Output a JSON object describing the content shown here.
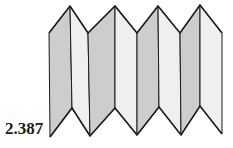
{
  "figure": {
    "label": "2.387",
    "colors": {
      "dark_panel": "#cdcdcd",
      "light_panel": "#efefef",
      "stroke": "#1a1a1a",
      "background": "#ffffff"
    },
    "top_vertices": [
      [
        49,
        33
      ],
      [
        70,
        6
      ],
      [
        88,
        33
      ],
      [
        115,
        6
      ],
      [
        137,
        33
      ],
      [
        158,
        6
      ],
      [
        180,
        33
      ],
      [
        200,
        5
      ],
      [
        222,
        33
      ]
    ],
    "bottom_vertices": [
      [
        50,
        137
      ],
      [
        72,
        108
      ],
      [
        90,
        136
      ],
      [
        115,
        108
      ],
      [
        137,
        135
      ],
      [
        159,
        107
      ],
      [
        181,
        135
      ],
      [
        200,
        106
      ],
      [
        222,
        134
      ]
    ],
    "panel_shades": [
      "dark",
      "light",
      "dark",
      "light",
      "dark",
      "light",
      "dark",
      "light"
    ]
  }
}
